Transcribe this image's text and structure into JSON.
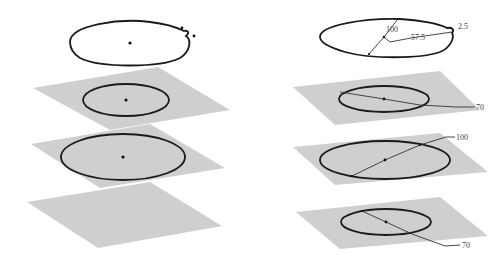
{
  "figure": {
    "left_panel": {
      "name": "lofted-profiles-without-dimensions",
      "profiles": [
        {
          "id": "top-guide-curve",
          "has_plane": false
        },
        {
          "id": "ellipse-1",
          "has_plane": true
        },
        {
          "id": "ellipse-2",
          "has_plane": true
        },
        {
          "id": "bottom-plane",
          "has_plane": true
        }
      ]
    },
    "right_panel": {
      "name": "lofted-profiles-with-dimensions",
      "dimensions": {
        "top_diameter": "100",
        "top_offset": "57.5",
        "top_small": "2.5",
        "plane1_diameter": "70",
        "plane2_diameter": "100",
        "plane3_diameter": "70"
      }
    },
    "colors": {
      "plane": "#cfcfcf",
      "curve": "#1a1a1a",
      "background": "#ffffff"
    }
  }
}
